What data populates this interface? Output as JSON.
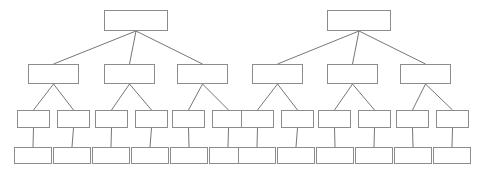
{
  "diagram": {
    "type": "organizational-hierarchy",
    "background_color": "#ffffff",
    "node_border_color": "#8c8c8c",
    "node_fill_color": "#ffffff",
    "connector_color": "#767676",
    "text_color": "#3b3b3b",
    "labels": {
      "arzobispo": "Arzobispo",
      "obispo": "Obispo",
      "rector": "Rector",
      "congregacion": "Congregación"
    },
    "trees": [
      {
        "name": "left-tree",
        "levels": [
          {
            "level": 1,
            "role": "arzobispo",
            "nodes": [
              {
                "label": "Arzobispo",
                "x": 104,
                "y": 10
              }
            ]
          },
          {
            "level": 2,
            "role": "obispo",
            "nodes": [
              {
                "label": "Obispo",
                "x": 28,
                "y": 64
              },
              {
                "label": "Obispo",
                "x": 104,
                "y": 64
              },
              {
                "label": "Obispo",
                "x": 177,
                "y": 64
              }
            ]
          },
          {
            "level": 3,
            "role": "rector",
            "nodes": [
              {
                "label": "Rector",
                "x": 17,
                "y": 110
              },
              {
                "label": "Rector",
                "x": 57,
                "y": 110
              },
              {
                "label": "Rector",
                "x": 95,
                "y": 110
              },
              {
                "label": "Rector",
                "x": 135,
                "y": 110
              },
              {
                "label": "Rector",
                "x": 172,
                "y": 110
              },
              {
                "label": "Rector",
                "x": 212,
                "y": 110
              }
            ]
          },
          {
            "level": 4,
            "role": "congregacion",
            "nodes": [
              {
                "label": "Congregación",
                "x": 14,
                "y": 147
              },
              {
                "label": "Congregación",
                "x": 53,
                "y": 147
              },
              {
                "label": "Congregación",
                "x": 92,
                "y": 147
              },
              {
                "label": "Congregación",
                "x": 131,
                "y": 147
              },
              {
                "label": "Congregación",
                "x": 170,
                "y": 147
              },
              {
                "label": "Congregación",
                "x": 209,
                "y": 147
              }
            ]
          }
        ]
      },
      {
        "name": "right-tree",
        "levels": [
          {
            "level": 1,
            "role": "arzobispo",
            "nodes": [
              {
                "label": "Arzobispo",
                "x": 327,
                "y": 10
              }
            ]
          },
          {
            "level": 2,
            "role": "obispo",
            "nodes": [
              {
                "label": "Obispo",
                "x": 252,
                "y": 64
              },
              {
                "label": "Obispo",
                "x": 327,
                "y": 64
              },
              {
                "label": "Obispo",
                "x": 400,
                "y": 64
              }
            ]
          },
          {
            "level": 3,
            "role": "rector",
            "nodes": [
              {
                "label": "Rector",
                "x": 241,
                "y": 110
              },
              {
                "label": "Rector",
                "x": 281,
                "y": 110
              },
              {
                "label": "Rector",
                "x": 318,
                "y": 110
              },
              {
                "label": "Rector",
                "x": 358,
                "y": 110
              },
              {
                "label": "Rector",
                "x": 396,
                "y": 110
              },
              {
                "label": "Rector",
                "x": 436,
                "y": 110
              }
            ]
          },
          {
            "level": 4,
            "role": "congregacion",
            "nodes": [
              {
                "label": "Congregación",
                "x": 238,
                "y": 147
              },
              {
                "label": "Congregación",
                "x": 277,
                "y": 147
              },
              {
                "label": "Congregación",
                "x": 316,
                "y": 147
              },
              {
                "label": "Congregación",
                "x": 355,
                "y": 147
              },
              {
                "label": "Congregación",
                "x": 394,
                "y": 147
              },
              {
                "label": "Congregación",
                "x": 433,
                "y": 147
              }
            ]
          }
        ]
      }
    ]
  }
}
